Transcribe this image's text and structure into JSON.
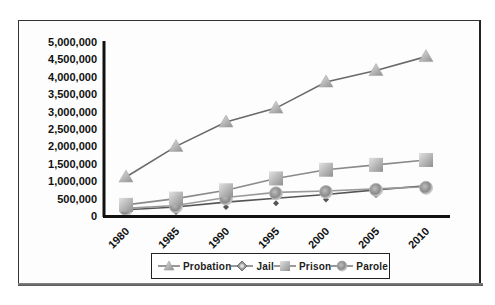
{
  "chart_data": {
    "type": "line",
    "title": "",
    "xlabel": "",
    "ylabel": "",
    "categories": [
      "1980",
      "1985",
      "1990",
      "1995",
      "2000",
      "2005",
      "2010"
    ],
    "series": [
      {
        "name": "Probation",
        "marker": "triangle",
        "values": [
          1120000,
          2000000,
          2700000,
          3100000,
          3850000,
          4180000,
          4580000
        ]
      },
      {
        "name": "Jail",
        "marker": "diamond",
        "values": [
          180000,
          260000,
          400000,
          510000,
          620000,
          750000,
          870000
        ]
      },
      {
        "name": "Prison",
        "marker": "square",
        "values": [
          320000,
          500000,
          740000,
          1080000,
          1330000,
          1470000,
          1610000
        ]
      },
      {
        "name": "Parole",
        "marker": "circle",
        "values": [
          220000,
          300000,
          530000,
          680000,
          720000,
          780000,
          840000
        ]
      }
    ],
    "yticks": [
      "0",
      "500,000",
      "1,000,000",
      "1,500,000",
      "2,000,000",
      "2,500,000",
      "3,000,000",
      "3,500,000",
      "4,000,000",
      "4,500,000",
      "5,000,000"
    ],
    "ylim": [
      0,
      5000000
    ],
    "grid": false,
    "legend_position": "bottom"
  },
  "legend": {
    "items": [
      {
        "label": "Probation",
        "marker": "triangle"
      },
      {
        "label": "Jail",
        "marker": "diamond"
      },
      {
        "label": "Prison",
        "marker": "square"
      },
      {
        "label": "Parole",
        "marker": "circle"
      }
    ]
  },
  "colors": {
    "line": "#6b6b6b",
    "marker_fill": "#b5b5b5",
    "axis": "#111111"
  }
}
